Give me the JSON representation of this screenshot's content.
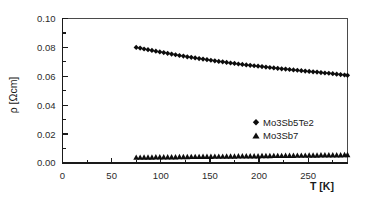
{
  "chart_data": {
    "type": "scatter",
    "title": "",
    "xlabel": "T [K]",
    "ylabel": "ρ [Ωcm]",
    "xlim": [
      0,
      290
    ],
    "ylim": [
      0.0,
      0.1
    ],
    "grid": false,
    "legend_position": "inside-right",
    "x_ticks": [
      0,
      50,
      100,
      150,
      200,
      250
    ],
    "x_tick_labels": [
      "0",
      "50",
      "100",
      "150",
      "200",
      "250"
    ],
    "x_minor_step": 25,
    "y_ticks": [
      0.0,
      0.02,
      0.04,
      0.06,
      0.08,
      0.1
    ],
    "y_tick_labels": [
      "0.00",
      "0.02",
      "0.04",
      "0.06",
      "0.08",
      "0.10"
    ],
    "y_minor_step": 0.01,
    "series": [
      {
        "name": "Mo3Sb5Te2",
        "marker": "diamond",
        "color": "#0d0d0d",
        "x": [
          75,
          79,
          83,
          87,
          91,
          95,
          99,
          103,
          107,
          111,
          115,
          119,
          123,
          127,
          131,
          135,
          139,
          143,
          147,
          151,
          155,
          159,
          163,
          167,
          171,
          175,
          179,
          183,
          187,
          191,
          195,
          199,
          203,
          207,
          211,
          215,
          219,
          223,
          227,
          231,
          235,
          239,
          243,
          247,
          251,
          255,
          259,
          263,
          267,
          271,
          275,
          279,
          283,
          287,
          290
        ],
        "y": [
          0.08,
          0.0795,
          0.0789,
          0.0784,
          0.0779,
          0.0774,
          0.0769,
          0.0764,
          0.0759,
          0.0754,
          0.0749,
          0.0744,
          0.074,
          0.0735,
          0.0731,
          0.0727,
          0.0723,
          0.0719,
          0.0715,
          0.0711,
          0.0707,
          0.0703,
          0.07,
          0.0696,
          0.0692,
          0.0689,
          0.0685,
          0.0682,
          0.0679,
          0.0676,
          0.0673,
          0.067,
          0.0667,
          0.0664,
          0.0661,
          0.0658,
          0.0655,
          0.0652,
          0.065,
          0.0647,
          0.0644,
          0.0642,
          0.0639,
          0.0636,
          0.0634,
          0.0631,
          0.0629,
          0.0626,
          0.0623,
          0.0621,
          0.0618,
          0.0615,
          0.0612,
          0.0609,
          0.0607
        ]
      },
      {
        "name": "Mo3Sb7",
        "marker": "triangle",
        "color": "#0d0d0d",
        "x": [
          75,
          79,
          83,
          87,
          91,
          95,
          99,
          103,
          107,
          111,
          115,
          119,
          123,
          127,
          131,
          135,
          139,
          143,
          147,
          151,
          155,
          159,
          163,
          167,
          171,
          175,
          179,
          183,
          187,
          191,
          195,
          199,
          203,
          207,
          211,
          215,
          219,
          223,
          227,
          231,
          235,
          239,
          243,
          247,
          251,
          255,
          259,
          263,
          267,
          271,
          275,
          279,
          283,
          287,
          290
        ],
        "y": [
          0.0036,
          0.0036,
          0.0037,
          0.0037,
          0.0037,
          0.0038,
          0.0038,
          0.0038,
          0.0039,
          0.0039,
          0.0039,
          0.004,
          0.004,
          0.004,
          0.0041,
          0.0041,
          0.0041,
          0.0042,
          0.0042,
          0.0042,
          0.0043,
          0.0043,
          0.0043,
          0.0044,
          0.0044,
          0.0044,
          0.0045,
          0.0045,
          0.0045,
          0.0046,
          0.0046,
          0.0046,
          0.0047,
          0.0047,
          0.0047,
          0.0048,
          0.0048,
          0.0048,
          0.0049,
          0.0049,
          0.0049,
          0.005,
          0.005,
          0.005,
          0.0051,
          0.0051,
          0.0051,
          0.0052,
          0.0052,
          0.0052,
          0.0053,
          0.0053,
          0.0053,
          0.0054,
          0.0054
        ]
      }
    ],
    "legend_entries": [
      {
        "label": "Mo3Sb5Te2",
        "marker": "diamond"
      },
      {
        "label": "Mo3Sb7",
        "marker": "triangle"
      }
    ]
  },
  "colors": {
    "background": "#ffffff",
    "axis": "#1a1a1a",
    "frame": "#4a4a4a",
    "marker": "#0d0d0d",
    "text": "#2b2b2b"
  }
}
